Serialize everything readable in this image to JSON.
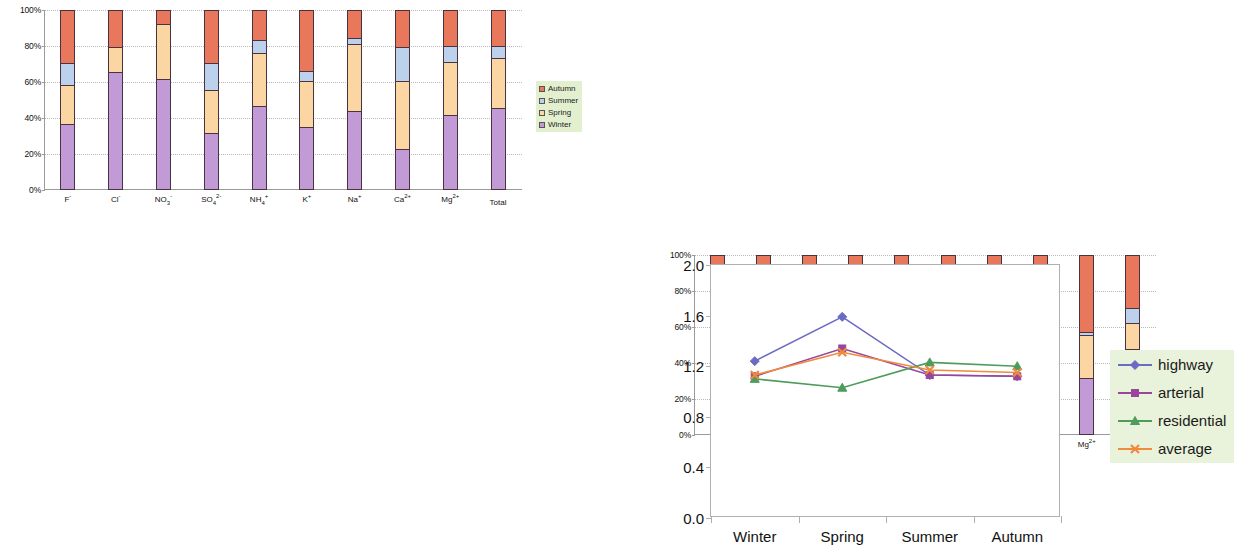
{
  "palette": {
    "autumn": "#E8775C",
    "summer": "#BCD2EC",
    "spring": "#FBD6A2",
    "winter": "#C29BD6",
    "segment_border": "#4a3340",
    "legend_bg": "#e3f0cf",
    "line_legend_bg": "#e9f3db",
    "highway": "#6B6BC4",
    "arterial": "#98459A",
    "residential": "#4E9C5C",
    "average": "#F08A3C"
  },
  "stacked_legend": {
    "items": [
      {
        "label": "Autumn",
        "color_key": "autumn"
      },
      {
        "label": "Summer",
        "color_key": "summer"
      },
      {
        "label": "Spring",
        "color_key": "spring"
      },
      {
        "label": "Winter",
        "color_key": "winter"
      }
    ]
  },
  "chart_data": [
    {
      "id": "top-left",
      "type": "bar",
      "stacked": true,
      "title": "",
      "xlabel": "",
      "ylabel": "",
      "ylim": [
        0,
        100
      ],
      "yticks": [
        0,
        20,
        40,
        60,
        80,
        100
      ],
      "ytick_labels": [
        "0%",
        "20%",
        "40%",
        "60%",
        "80%",
        "100%"
      ],
      "grid": true,
      "legend_position": "right",
      "categories": [
        "F-",
        "Cl-",
        "NO3-",
        "SO4 2-",
        "NH4+",
        "K+",
        "Na+",
        "Ca2+",
        "Mg2+",
        "Total"
      ],
      "category_labels_html": [
        "F<sup>-</sup>",
        "Cl<sup>-</sup>",
        "NO<sub>3</sub><sup>-</sup>",
        "SO<sub>4</sub><sup>2-</sup>",
        "NH<sub>4</sub><sup>+</sup>",
        "K<sup>+</sup>",
        "Na<sup>+</sup>",
        "Ca<sup>2+</sup>",
        "Mg<sup>2+</sup>",
        "Total"
      ],
      "series": [
        {
          "name": "Winter",
          "color_key": "winter",
          "values": [
            36,
            65,
            61,
            31,
            46,
            34,
            43,
            22,
            41,
            45
          ]
        },
        {
          "name": "Spring",
          "color_key": "spring",
          "values": [
            22,
            14,
            31,
            24,
            30,
            26,
            38,
            38,
            30,
            28
          ]
        },
        {
          "name": "Summer",
          "color_key": "summer",
          "values": [
            12,
            0,
            0,
            15,
            7,
            6,
            3,
            19,
            9,
            7
          ]
        },
        {
          "name": "Autumn",
          "color_key": "autumn",
          "values": [
            30,
            21,
            8,
            30,
            17,
            34,
            16,
            21,
            20,
            20
          ]
        }
      ]
    },
    {
      "id": "top-right",
      "type": "bar",
      "stacked": true,
      "title": "",
      "xlabel": "",
      "ylabel": "",
      "ylim": [
        0,
        100
      ],
      "yticks": [
        0,
        20,
        40,
        60,
        80,
        100
      ],
      "ytick_labels": [
        "0%",
        "20%",
        "40%",
        "60%",
        "80%",
        "100%"
      ],
      "grid": true,
      "legend_position": "right",
      "categories": [
        "F-",
        "Cl-",
        "NO3-",
        "SO4 2-",
        "NH4+",
        "K+",
        "Na+",
        "Ca2+",
        "Mg2+",
        "Total"
      ],
      "category_labels_html": [
        "F<sup>-</sup>",
        "Cl<sup>-</sup>",
        "NO<sub>3</sub><sup>-</sup>",
        "SO<sub>4</sub><sup>2-</sup>",
        "NH<sub>4</sub><sup>+</sup>",
        "K<sup>+</sup>",
        "Na<sup>+</sup>",
        "Ca<sup>2+</sup>",
        "Mg<sup>2+</sup>",
        "Total"
      ],
      "series": [
        {
          "name": "Winter",
          "color_key": "winter",
          "values": [
            52,
            65,
            64,
            30,
            49,
            37,
            43,
            26,
            31,
            47
          ]
        },
        {
          "name": "Spring",
          "color_key": "spring",
          "values": [
            3,
            3,
            16,
            21,
            16,
            14,
            24,
            31,
            24,
            15
          ]
        },
        {
          "name": "Summer",
          "color_key": "summer",
          "values": [
            1,
            1,
            5,
            10,
            6,
            3,
            0,
            17,
            2,
            8
          ]
        },
        {
          "name": "Autumn",
          "color_key": "autumn",
          "values": [
            44,
            31,
            15,
            39,
            29,
            46,
            33,
            26,
            43,
            30
          ]
        }
      ]
    },
    {
      "id": "bottom-left",
      "type": "bar",
      "stacked": true,
      "title": "",
      "xlabel": "",
      "ylabel": "",
      "ylim": [
        0,
        100
      ],
      "yticks": [
        0,
        20,
        40,
        60,
        80,
        100
      ],
      "ytick_labels": [
        "0%",
        "20%",
        "40%",
        "60%",
        "80%",
        "100%"
      ],
      "grid": true,
      "legend_position": "right",
      "categories": [
        "F-",
        "Cl-",
        "NO3-",
        "SO4 2-",
        "NH4+",
        "K+",
        "Na+",
        "Ca2+",
        "Mg3+",
        "Total"
      ],
      "category_labels_html": [
        "F<sup>-</sup>",
        "Cl<sup>-</sup>",
        "NO<sub>3</sub><sup>-</sup>",
        "SO<sub>4</sub><sup>2-</sup>",
        "NH<sub>4</sub><sup>+</sup>",
        "K<sup>+</sup>",
        "Na<sup>+</sup>",
        "Ca<sup>2+</sup>",
        "Mg<sup>3+</sup>",
        "Total"
      ],
      "series": [
        {
          "name": "Winter",
          "color_key": "winter",
          "values": [
            43,
            59,
            52,
            28,
            40,
            34,
            34,
            25,
            32,
            40
          ]
        },
        {
          "name": "Spring",
          "color_key": "spring",
          "values": [
            15,
            12,
            34,
            25,
            29,
            20,
            30,
            32,
            28,
            31
          ]
        },
        {
          "name": "Summer",
          "color_key": "summer",
          "values": [
            3,
            0,
            2,
            12,
            6,
            5,
            12,
            18,
            11,
            4
          ]
        },
        {
          "name": "Autumn",
          "color_key": "autumn",
          "values": [
            39,
            29,
            12,
            35,
            25,
            41,
            24,
            25,
            29,
            25
          ]
        }
      ]
    },
    {
      "id": "bottom-right",
      "type": "line",
      "title": "",
      "xlabel": "",
      "ylabel": "",
      "ylim": [
        0,
        2.0
      ],
      "yticks": [
        0.0,
        0.4,
        0.8,
        1.2,
        1.6,
        2.0
      ],
      "ytick_labels": [
        "0.0",
        "0.4",
        "0.8",
        "1.2",
        "1.6",
        "2.0"
      ],
      "grid": false,
      "legend_position": "right",
      "categories": [
        "Winter",
        "Spring",
        "Summer",
        "Autumn"
      ],
      "series": [
        {
          "name": "highway",
          "color_key": "highway",
          "marker": "diamond",
          "values": [
            1.24,
            1.59,
            1.13,
            1.12
          ]
        },
        {
          "name": "arterial",
          "color_key": "arterial",
          "marker": "square",
          "values": [
            1.12,
            1.34,
            1.13,
            1.12
          ]
        },
        {
          "name": "residential",
          "color_key": "residential",
          "marker": "triangle",
          "values": [
            1.1,
            1.03,
            1.23,
            1.2
          ]
        },
        {
          "name": "average",
          "color_key": "average",
          "marker": "cross",
          "values": [
            1.13,
            1.31,
            1.17,
            1.15
          ]
        }
      ]
    }
  ]
}
